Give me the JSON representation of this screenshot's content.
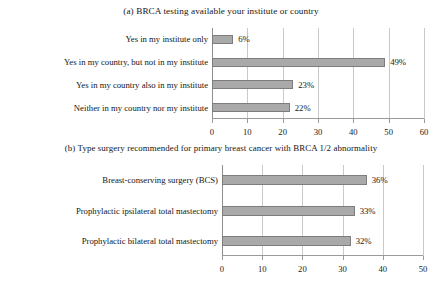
{
  "chart_data": [
    {
      "type": "bar",
      "orientation": "horizontal",
      "title": "(a) BRCA testing available your institute or country",
      "xlabel": "",
      "ylabel": "",
      "xlim": [
        0,
        60
      ],
      "xticks": [
        0,
        10,
        20,
        30,
        40,
        50,
        60
      ],
      "grid": true,
      "legend": "none",
      "bar_color": "#a9a9a9",
      "bar_border_color": "#7d7d7d",
      "categories": [
        "Yes in my institute only",
        "Yes in my country, but not in my institute",
        "Yes in my country also in my institute",
        "Neither in my country nor my institute"
      ],
      "values": [
        6,
        49,
        23,
        22
      ],
      "data_labels": [
        "6%",
        "49%",
        "23%",
        "22%"
      ]
    },
    {
      "type": "bar",
      "orientation": "horizontal",
      "title": "(b) Type surgery recommended for primary breast cancer with BRCA 1/2 abnormality",
      "xlabel": "",
      "ylabel": "",
      "xlim": [
        0,
        50
      ],
      "xticks": [
        0,
        10,
        20,
        30,
        40,
        50
      ],
      "grid": true,
      "legend": "none",
      "bar_color": "#a9a9a9",
      "bar_border_color": "#7d7d7d",
      "categories": [
        "Breast-conserving surgery (BCS)",
        "Prophylactic ipsilateral total mastectomy",
        "Prophylactic bilateral total mastectomy"
      ],
      "values": [
        36,
        33,
        32
      ],
      "data_labels": [
        "36%",
        "33%",
        "32%"
      ]
    }
  ]
}
